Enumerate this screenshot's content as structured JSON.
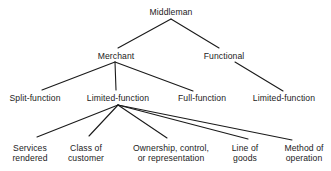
{
  "diagram": {
    "type": "tree",
    "line_color": "#1a1a1a",
    "nodes": {
      "root": {
        "label": "Middleman"
      },
      "merchant": {
        "label": "Merchant"
      },
      "functional": {
        "label": "Functional"
      },
      "split_function": {
        "label": "Split-function"
      },
      "limited_function_merchant": {
        "label": "Limited-function"
      },
      "full_function": {
        "label": "Full-function"
      },
      "limited_function_functional": {
        "label": "Limited-function"
      },
      "services_rendered": {
        "line1": "Services",
        "line2": "rendered"
      },
      "class_of_customer": {
        "line1": "Class of",
        "line2": "customer"
      },
      "ownership": {
        "line1": "Ownership, control,",
        "line2": "or representation"
      },
      "line_of_goods": {
        "line1": "Line of",
        "line2": "goods"
      },
      "method_of_operation": {
        "line1": "Method of",
        "line2": "operation"
      }
    },
    "edges": [
      [
        "root",
        "merchant"
      ],
      [
        "root",
        "functional"
      ],
      [
        "merchant",
        "split_function"
      ],
      [
        "merchant",
        "limited_function_merchant"
      ],
      [
        "merchant",
        "full_function"
      ],
      [
        "functional",
        "limited_function_functional"
      ],
      [
        "limited_function_merchant",
        "services_rendered"
      ],
      [
        "limited_function_merchant",
        "class_of_customer"
      ],
      [
        "limited_function_merchant",
        "ownership"
      ],
      [
        "limited_function_merchant",
        "line_of_goods"
      ],
      [
        "limited_function_merchant",
        "method_of_operation"
      ]
    ]
  }
}
